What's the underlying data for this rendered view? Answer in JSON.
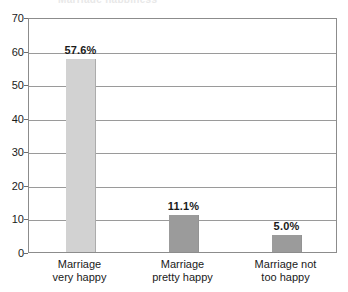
{
  "chart_data": {
    "type": "bar",
    "title": "",
    "title_remnant": "Marriage happiness",
    "xlabel": "",
    "ylabel": "",
    "categories": [
      "Marriage very happy",
      "Marriage pretty happy",
      "Marriage not too happy"
    ],
    "category_lines": [
      [
        "Marriage",
        "very happy"
      ],
      [
        "Marriage",
        "pretty happy"
      ],
      [
        "Marriage not",
        "too happy"
      ]
    ],
    "values": [
      57.6,
      11.1,
      5.0
    ],
    "data_labels": [
      "57.6%",
      "11.1%",
      "5.0%"
    ],
    "bar_colors": [
      "#d2d2d2",
      "#9b9b9b",
      "#9b9b9b"
    ],
    "ylim": [
      0,
      70
    ],
    "yticks": [
      70,
      60,
      50,
      40,
      30,
      20,
      10,
      0
    ],
    "ytick_labels": [
      "70",
      "60",
      "50",
      "40",
      "30",
      "20",
      "10",
      "0"
    ],
    "grid": true,
    "grid_color": "#9a9a9a",
    "legend": null,
    "frame_color": "#8c8c8c",
    "background": "#ffffff"
  }
}
